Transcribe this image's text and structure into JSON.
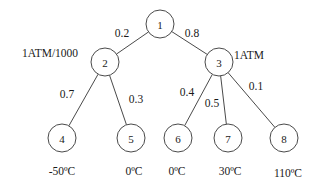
{
  "diagram": {
    "type": "probability-tree",
    "stroke_color": "#4a4a4a",
    "background_color": "#ffffff",
    "nodes": [
      {
        "id": "1",
        "label": "1",
        "cx": 160,
        "cy": 24,
        "r": 14
      },
      {
        "id": "2",
        "label": "2",
        "cx": 105,
        "cy": 62,
        "r": 14
      },
      {
        "id": "3",
        "label": "3",
        "cx": 219,
        "cy": 62,
        "r": 14
      },
      {
        "id": "4",
        "label": "4",
        "cx": 62,
        "cy": 138,
        "r": 14
      },
      {
        "id": "5",
        "label": "5",
        "cx": 131,
        "cy": 138,
        "r": 14
      },
      {
        "id": "6",
        "label": "6",
        "cx": 178,
        "cy": 138,
        "r": 14
      },
      {
        "id": "7",
        "label": "7",
        "cx": 228,
        "cy": 138,
        "r": 14
      },
      {
        "id": "8",
        "label": "8",
        "cx": 284,
        "cy": 138,
        "r": 14
      }
    ],
    "edges": [
      {
        "from": "1",
        "to": "2",
        "weight": "0.2",
        "label_x": 122,
        "label_y": 33
      },
      {
        "from": "1",
        "to": "3",
        "weight": "0.8",
        "label_x": 192,
        "label_y": 33
      },
      {
        "from": "2",
        "to": "4",
        "weight": "0.7",
        "label_x": 67,
        "label_y": 94
      },
      {
        "from": "2",
        "to": "5",
        "weight": "0.3",
        "label_x": 136,
        "label_y": 99
      },
      {
        "from": "3",
        "to": "6",
        "weight": "0.4",
        "label_x": 187,
        "label_y": 92
      },
      {
        "from": "3",
        "to": "7",
        "weight": "0.5",
        "label_x": 212,
        "label_y": 103
      },
      {
        "from": "3",
        "to": "8",
        "weight": "0.1",
        "label_x": 256,
        "label_y": 86
      }
    ],
    "annotations": [
      {
        "id": "left-pressure",
        "text": "1ATM/1000",
        "x": 50,
        "y": 53
      },
      {
        "id": "right-pressure",
        "text": "1ATM",
        "x": 249,
        "y": 55
      }
    ],
    "leaf_captions": [
      {
        "for_node": "4",
        "text": "-50ºC",
        "x": 62,
        "y": 171
      },
      {
        "for_node": "5",
        "text": "0ºC",
        "x": 134,
        "y": 171
      },
      {
        "for_node": "6",
        "text": "0ºC",
        "x": 177,
        "y": 171
      },
      {
        "for_node": "7",
        "text": "30ºC",
        "x": 230,
        "y": 171
      },
      {
        "for_node": "8",
        "text": "110ºC",
        "x": 288,
        "y": 173
      }
    ]
  }
}
